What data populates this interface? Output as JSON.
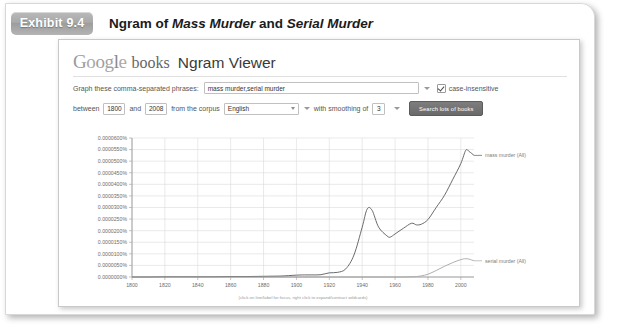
{
  "exhibit": {
    "tag": "Exhibit 9.4",
    "title_prefix": "Ngram of ",
    "title_em1": "Mass Murder",
    "title_mid": " and ",
    "title_em2": "Serial Murder"
  },
  "logo": {
    "google": "Google",
    "books": "books",
    "ngram_viewer": "Ngram Viewer"
  },
  "form": {
    "phrases_label": "Graph these comma-separated phrases:",
    "phrases_value": "mass murder,serial murder",
    "case_insensitive_label": "case-insensitive",
    "case_insensitive_checked": "true",
    "between_label": "between",
    "start_year": "1800",
    "and_label": "and",
    "end_year": "2008",
    "corpus_label": "from the corpus",
    "corpus_value": "English",
    "smoothing_label": "with smoothing of",
    "smoothing_value": "3",
    "search_button": "Search lots of books"
  },
  "chart_data": {
    "type": "line",
    "title": "",
    "xlabel": "",
    "ylabel": "",
    "caption": "(click on line/label for focus, right click to expand/contract wildcards)",
    "grid": true,
    "legend_position": "right-inline",
    "xlim": [
      1800,
      2008
    ],
    "ylim": [
      0.0,
      6e-05
    ],
    "xticks": [
      "1800",
      "1820",
      "1840",
      "1860",
      "1880",
      "1900",
      "1920",
      "1940",
      "1960",
      "1980",
      "2000"
    ],
    "yticks": [
      "0.0000600%",
      "0.0000550%",
      "0.0000500%",
      "0.0000450%",
      "0.0000400%",
      "0.0000350%",
      "0.0000300%",
      "0.0000250%",
      "0.0000200%",
      "0.0000150%",
      "0.0000100%",
      "0.0000050%",
      "0.0000000%"
    ],
    "x": [
      1800,
      1810,
      1820,
      1830,
      1840,
      1850,
      1860,
      1870,
      1880,
      1890,
      1900,
      1905,
      1910,
      1915,
      1920,
      1925,
      1930,
      1935,
      1940,
      1943,
      1946,
      1950,
      1955,
      1957,
      1960,
      1965,
      1970,
      1973,
      1976,
      1980,
      1985,
      1990,
      1995,
      2000,
      2003,
      2005,
      2008
    ],
    "series": [
      {
        "name": "mass murder (All)",
        "label": "mass murder (All)",
        "color": "#5a5a5a",
        "values": [
          0.0,
          0.0,
          1e-07,
          1e-07,
          1e-07,
          1e-07,
          2e-07,
          2e-07,
          3e-07,
          4e-07,
          8e-07,
          9e-07,
          9e-07,
          1e-06,
          1.8e-06,
          2e-06,
          3.5e-06,
          9.5e-06,
          2.15e-05,
          2.93e-05,
          2.88e-05,
          2.15e-05,
          1.78e-05,
          1.72e-05,
          1.86e-05,
          2.1e-05,
          2.32e-05,
          2.25e-05,
          2.28e-05,
          2.48e-05,
          3e-05,
          3.52e-05,
          4.2e-05,
          4.9e-05,
          5.47e-05,
          5.42e-05,
          5.25e-05
        ]
      },
      {
        "name": "serial murder (All)",
        "label": "serial murder (All)",
        "color": "#a6a6a6",
        "values": [
          0.0,
          0.0,
          0.0,
          0.0,
          0.0,
          0.0,
          0.0,
          0.0,
          0.0,
          0.0,
          0.0,
          0.0,
          0.0,
          0.0,
          0.0,
          0.0,
          0.0,
          0.0,
          0.0,
          0.0,
          0.0,
          0.0,
          0.0,
          0.0,
          0.0,
          0.0,
          1e-07,
          2e-07,
          5e-07,
          1.2e-06,
          2.8e-06,
          4.6e-06,
          6.2e-06,
          7.5e-06,
          7.9e-06,
          7.7e-06,
          7e-06
        ]
      }
    ]
  }
}
